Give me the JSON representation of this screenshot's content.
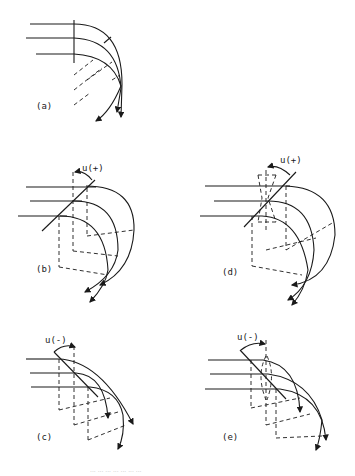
{
  "figure": {
    "panels": [
      {
        "id": "a",
        "label": "(a)",
        "angle_label": ""
      },
      {
        "id": "b",
        "label": "(b)",
        "angle_label": "u(+)"
      },
      {
        "id": "c",
        "label": "(c)",
        "angle_label": "u(-)"
      },
      {
        "id": "d",
        "label": "(d)",
        "angle_label": "u(+)"
      },
      {
        "id": "e",
        "label": "(e)",
        "angle_label": "u(-)"
      }
    ],
    "caption_partial": "... ... ... ... ... ... ..."
  },
  "colors": {
    "ink": "#1a1a1a",
    "background": "#ffffff"
  }
}
